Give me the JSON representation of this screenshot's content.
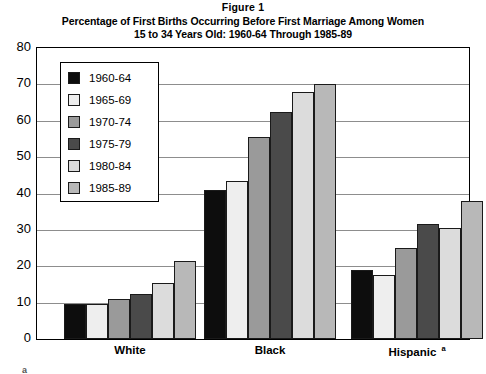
{
  "title": {
    "line1": "Figure 1",
    "line2": "Percentage of First Births Occurring Before First Marriage Among Women",
    "line3": "15 to 34 Years Old: 1960-64 Through 1985-89"
  },
  "footnote_marker": "a",
  "legend": {
    "position": "inside-top-left",
    "items": [
      {
        "label": "1960-64",
        "color": "#0d0d0d"
      },
      {
        "label": "1965-69",
        "color": "#eeeeee"
      },
      {
        "label": "1970-74",
        "color": "#9a9a9a"
      },
      {
        "label": "1975-79",
        "color": "#4a4a4a"
      },
      {
        "label": "1980-84",
        "color": "#dcdcdc"
      },
      {
        "label": "1985-89",
        "color": "#b8b8b8"
      }
    ]
  },
  "axes": {
    "y_ticks": [
      "80",
      "70",
      "60",
      "50",
      "40",
      "30",
      "20",
      "10",
      "0"
    ],
    "x_tick_labels": [
      "White",
      "Black",
      "Hispanic"
    ],
    "hispanic_superscript": "a"
  },
  "chart_data": {
    "type": "bar",
    "xlabel": "",
    "ylabel": "",
    "ylim": [
      0,
      80
    ],
    "ytick_step": 10,
    "grid": "horizontal",
    "legend_position": "inside-top-left",
    "categories": [
      "White",
      "Black",
      "Hispanic"
    ],
    "series": [
      {
        "name": "1960-64",
        "color": "#0d0d0d",
        "values": [
          9.5,
          41.0,
          19.0
        ]
      },
      {
        "name": "1965-69",
        "color": "#eeeeee",
        "values": [
          9.5,
          43.5,
          17.5
        ]
      },
      {
        "name": "1970-74",
        "color": "#9a9a9a",
        "values": [
          11.0,
          55.5,
          25.0
        ]
      },
      {
        "name": "1975-79",
        "color": "#4a4a4a",
        "values": [
          12.5,
          62.5,
          31.5
        ]
      },
      {
        "name": "1980-84",
        "color": "#dcdcdc",
        "values": [
          15.5,
          68.0,
          30.5
        ]
      },
      {
        "name": "1985-89",
        "color": "#b8b8b8",
        "values": [
          21.5,
          70.0,
          38.0
        ]
      }
    ]
  }
}
